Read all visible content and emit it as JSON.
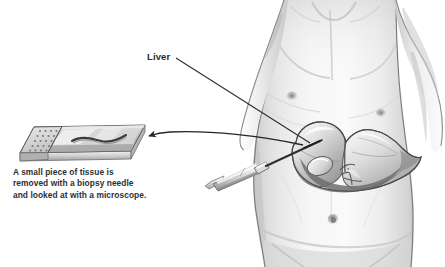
{
  "figure": {
    "width": 445,
    "height": 267,
    "background_color": "#ffffff",
    "style": "grayscale pencil medical illustration"
  },
  "labels": {
    "liver": "Liver"
  },
  "caption": {
    "line1": "A small piece of tissue is",
    "line2": "removed with a biopsy needle",
    "line3": "and looked at with a microscope.",
    "full_text": "A small piece of tissue is removed with a biopsy needle and looked at with a microscope."
  },
  "anatomy": {
    "torso_name": "male torso",
    "liver_name": "liver",
    "liver_parts": [
      "right lobe",
      "left lobe",
      "gallbladder",
      "hepatic vessels"
    ],
    "navel_name": "navel",
    "nipple_left_name": "nipple",
    "nipple_right_name": "nipple"
  },
  "instruments": {
    "syringe_name": "biopsy needle syringe",
    "slide_name": "microscope slide",
    "specimen_name": "tissue core specimen",
    "frosted_end_name": "frosted label end"
  },
  "annotations": {
    "liver_leader_line": "leader line from Liver label to liver organ",
    "specimen_arrow": "curved arrow from liver to microscope slide"
  },
  "colors": {
    "ink": "#2b2b2b",
    "skin_light": "#f4f4f4",
    "skin_mid": "#d9d9d9",
    "skin_shadow": "#b4b4b4",
    "organ_light": "#efefef",
    "organ_mid": "#c3c3c3",
    "organ_dark": "#7e7e7e",
    "glass_light": "#ededed",
    "glass_mid": "#c8c8c8",
    "glass_dark": "#9a9a9a",
    "outline": "#4a4a4a",
    "background": "#ffffff"
  }
}
